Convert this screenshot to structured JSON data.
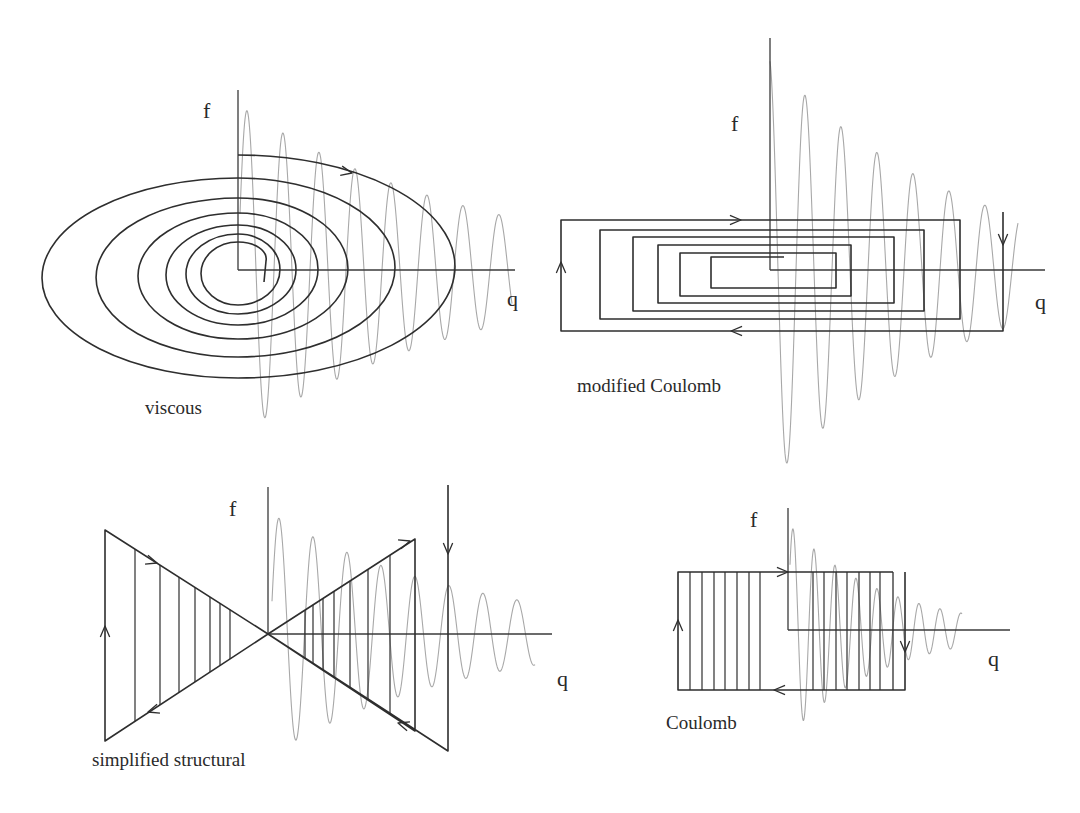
{
  "figure": {
    "colors": {
      "trajectory": "#2e2e2e",
      "axis": "#3a3a3a",
      "wave": "#a8a8a8",
      "text": "#2a2a2a",
      "background": "#ffffff"
    },
    "panels": [
      {
        "id": "viscous",
        "caption": "viscous",
        "x_axis_label": "q",
        "y_axis_label": "f",
        "loop_shape": "elliptical spiral (decaying)",
        "loop_count": 7,
        "origin": [
          238,
          270
        ],
        "wave": {
          "start_x": 240,
          "period_px": 36,
          "initial_amplitude_px": 164,
          "decay_per_cycle": 0.86,
          "cycles": 8
        },
        "caption_pos": [
          145,
          400
        ],
        "f_pos": [
          203,
          100
        ],
        "q_pos": [
          507,
          290
        ]
      },
      {
        "id": "modified-coulomb",
        "caption": "modified Coulomb",
        "x_axis_label": "q",
        "y_axis_label": "f",
        "loop_shape": "nested rectangular spiral",
        "loop_count": 7,
        "origin": [
          770,
          270
        ],
        "wave": {
          "start_x": 770,
          "period_px": 36,
          "initial_amplitude_px": 212,
          "decay_per_cycle": 0.82,
          "cycles": 7
        },
        "caption_pos": [
          577,
          377
        ],
        "f_pos": [
          731,
          115
        ],
        "q_pos": [
          1035,
          293
        ]
      },
      {
        "id": "simplified-structural",
        "caption": "simplified structural",
        "x_axis_label": "q",
        "y_axis_label": "f",
        "loop_shape": "bow-tie (linear hysteresis) with vertical hatches",
        "loop_count": 1,
        "origin": [
          268,
          634
        ],
        "wave": {
          "start_x": 272,
          "period_px": 34,
          "initial_amplitude_px": 120,
          "decay_per_cycle": 0.84,
          "cycles": 8
        },
        "caption_pos": [
          92,
          753
        ],
        "f_pos": [
          229,
          500
        ],
        "q_pos": [
          557,
          670
        ]
      },
      {
        "id": "coulomb",
        "caption": "Coulomb",
        "x_axis_label": "q",
        "y_axis_label": "f",
        "loop_shape": "rectangle (constant friction) with vertical hatches",
        "loop_count": 1,
        "origin": [
          788,
          630
        ],
        "wave": {
          "start_x": 790,
          "period_px": 21,
          "initial_amplitude_px": 110,
          "decay_per_cycle": 0.8,
          "cycles": 8
        },
        "caption_pos": [
          666,
          715
        ],
        "f_pos": [
          750,
          512
        ],
        "q_pos": [
          988,
          650
        ]
      }
    ]
  }
}
